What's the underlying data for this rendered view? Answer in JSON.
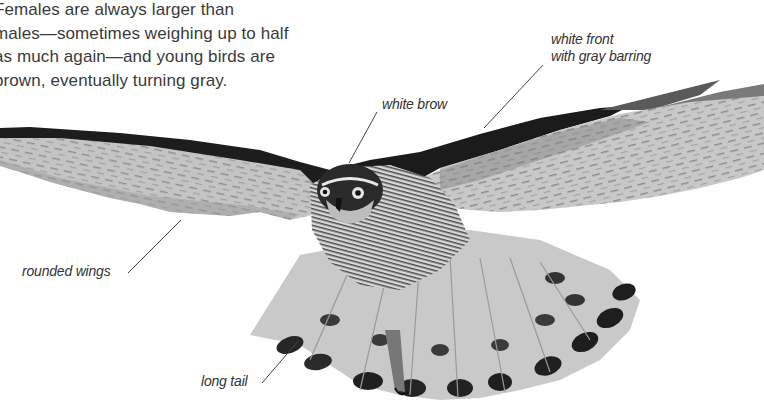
{
  "intro_text": "Females are always larger than males—sometimes weighing up to half as much again—and young birds are brown, eventually turning gray.",
  "intro_lines": [
    "Females are always larger than",
    "males—sometimes weighing up to half",
    "as much again—and young birds are",
    "brown, eventually turning gray."
  ],
  "callouts": {
    "white_front": {
      "line1": "white front",
      "line2": "with gray barring"
    },
    "white_brow": "white brow",
    "rounded_wings": "rounded wings",
    "long_tail": "long tail"
  },
  "image": {
    "subject": "bird-of-prey-in-flight",
    "style": "grayscale photograph"
  },
  "colors": {
    "background": "#ffffff",
    "text": "#3a3a3a",
    "leader_line": "#444444"
  }
}
